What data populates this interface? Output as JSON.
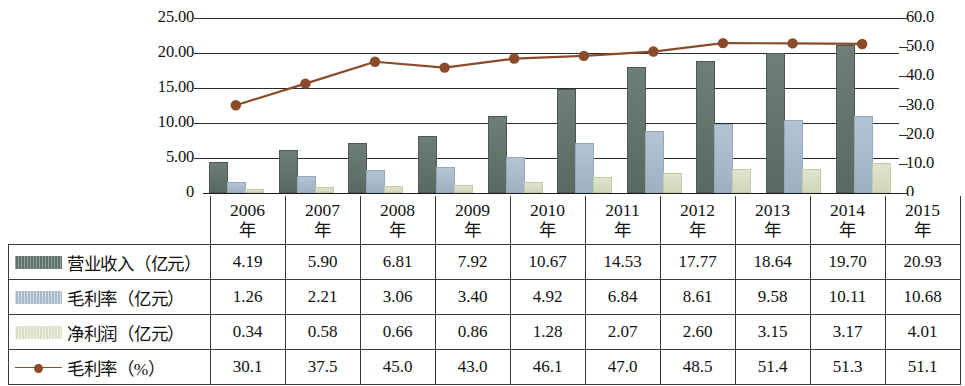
{
  "chart_data": {
    "type": "bar",
    "title": "",
    "subtitle": "",
    "xlabel": "",
    "ylabel": "",
    "grid": true,
    "legend_position": "table-left-column",
    "categories": [
      "2006年",
      "2007年",
      "2008年",
      "2009年",
      "2010年",
      "2011年",
      "2012年",
      "2013年",
      "2014年",
      "2015年"
    ],
    "left_axis": {
      "label": "",
      "ticks": [
        "0",
        "5.00",
        "10.00",
        "15.00",
        "20.00",
        "25.00"
      ],
      "ylim": [
        0,
        25
      ]
    },
    "right_axis": {
      "label": "",
      "ticks": [
        "0",
        "10.0",
        "20.0",
        "30.0",
        "40.0",
        "50.0",
        "60.0"
      ],
      "ylim": [
        0,
        60
      ]
    },
    "series": [
      {
        "name": "营业收入（亿元）",
        "type": "bar",
        "axis": "left",
        "color": "#5e7068",
        "values": [
          4.19,
          5.9,
          6.81,
          7.92,
          10.67,
          14.53,
          17.77,
          18.64,
          19.7,
          20.93
        ],
        "labels": [
          "4.19",
          "5.90",
          "6.81",
          "7.92",
          "10.67",
          "14.53",
          "17.77",
          "18.64",
          "19.70",
          "20.93"
        ]
      },
      {
        "name": "毛利率（亿元）",
        "type": "bar",
        "axis": "left",
        "color": "#a7bacb",
        "values": [
          1.26,
          2.21,
          3.06,
          3.4,
          4.92,
          6.84,
          8.61,
          9.58,
          10.11,
          10.68
        ],
        "labels": [
          "1.26",
          "2.21",
          "3.06",
          "3.40",
          "4.92",
          "6.84",
          "8.61",
          "9.58",
          "10.11",
          "10.68"
        ]
      },
      {
        "name": "净利润（亿元）",
        "type": "bar",
        "axis": "left",
        "color": "#d8dfc2",
        "values": [
          0.34,
          0.58,
          0.66,
          0.86,
          1.28,
          2.07,
          2.6,
          3.15,
          3.17,
          4.01
        ],
        "labels": [
          "0.34",
          "0.58",
          "0.66",
          "0.86",
          "1.28",
          "2.07",
          "2.60",
          "3.15",
          "3.17",
          "4.01"
        ]
      },
      {
        "name": "毛利率（%）",
        "type": "line",
        "axis": "right",
        "color": "#8a4b2a",
        "marker": "circle",
        "values": [
          30.1,
          37.5,
          45.0,
          43.0,
          46.1,
          47.0,
          48.5,
          51.4,
          51.3,
          51.1
        ],
        "labels": [
          "30.1",
          "37.5",
          "45.0",
          "43.0",
          "46.1",
          "47.0",
          "48.5",
          "51.4",
          "51.3",
          "51.1"
        ]
      }
    ]
  },
  "table": {
    "corner_label": "",
    "header": [
      "2006年",
      "2007年",
      "2008年",
      "2009年",
      "2010年",
      "2011年",
      "2012年",
      "2013年",
      "2014年",
      "2015年"
    ],
    "header_lines": [
      [
        "2006",
        "年"
      ],
      [
        "2007",
        "年"
      ],
      [
        "2008",
        "年"
      ],
      [
        "2009",
        "年"
      ],
      [
        "2010",
        "年"
      ],
      [
        "2011",
        "年"
      ],
      [
        "2012",
        "年"
      ],
      [
        "2013",
        "年"
      ],
      [
        "2014",
        "年"
      ],
      [
        "2015",
        "年"
      ]
    ],
    "rows": [
      {
        "label": "营业收入（亿元）",
        "swatch": "rev",
        "values": [
          "4.19",
          "5.90",
          "6.81",
          "7.92",
          "10.67",
          "14.53",
          "17.77",
          "18.64",
          "19.70",
          "20.93"
        ]
      },
      {
        "label": "毛利率（亿元）",
        "swatch": "gross",
        "values": [
          "1.26",
          "2.21",
          "3.06",
          "3.40",
          "4.92",
          "6.84",
          "8.61",
          "9.58",
          "10.11",
          "10.68"
        ]
      },
      {
        "label": "净利润（亿元）",
        "swatch": "net",
        "values": [
          "0.34",
          "0.58",
          "0.66",
          "0.86",
          "1.28",
          "2.07",
          "2.60",
          "3.15",
          "3.17",
          "4.01"
        ]
      },
      {
        "label": "毛利率（%）",
        "swatch": "line",
        "values": [
          "30.1",
          "37.5",
          "45.0",
          "43.0",
          "46.1",
          "47.0",
          "48.5",
          "51.4",
          "51.3",
          "51.1"
        ]
      }
    ]
  },
  "axis_zero": {
    "left": "0",
    "right": "0"
  },
  "colors": {
    "revenue_bar": "#5e7068",
    "gross_bar": "#a7bacb",
    "net_bar": "#d8dfc2",
    "line": "#8a4b2a",
    "grid": "#2b2b2b",
    "border": "#3a3a3a"
  }
}
